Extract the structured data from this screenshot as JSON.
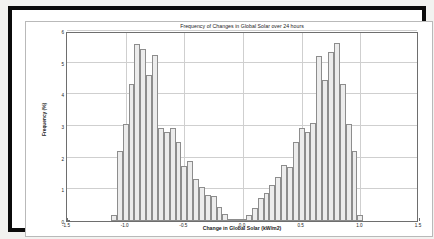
{
  "chart_data": {
    "type": "bar",
    "title": "Frequency of Changes in Global Solar over 24 hours",
    "xlabel": "Change in Global Solar (kW/m2)",
    "ylabel": "Frequency (%)",
    "xlim": [
      -1.5,
      1.5
    ],
    "ylim": [
      0,
      6
    ],
    "xticks": [
      "-1.5",
      "-1.0",
      "-0.5",
      "0.0",
      "0.5",
      "1.0",
      "1.5"
    ],
    "xtick_values": [
      -1.5,
      -1.0,
      -0.5,
      0.0,
      0.5,
      1.0,
      1.5
    ],
    "yticks": [
      "0",
      "1",
      "2",
      "3",
      "4",
      "5",
      "6"
    ],
    "ytick_values": [
      0,
      1,
      2,
      3,
      4,
      5,
      6
    ],
    "grid": true,
    "legend": null,
    "bin_width": 0.05,
    "bar_fill": "#ececec",
    "bar_edge": "#8d8d8d",
    "x": [
      -1.1,
      -1.05,
      -1.0,
      -0.95,
      -0.9,
      -0.85,
      -0.8,
      -0.75,
      -0.7,
      -0.65,
      -0.6,
      -0.55,
      -0.5,
      -0.45,
      -0.4,
      -0.35,
      -0.3,
      -0.25,
      -0.2,
      -0.15,
      -0.1,
      -0.05,
      0.0,
      0.05,
      0.1,
      0.15,
      0.2,
      0.25,
      0.3,
      0.35,
      0.4,
      0.45,
      0.5,
      0.55,
      0.6,
      0.65,
      0.7,
      0.75,
      0.8,
      0.85,
      0.9,
      0.95,
      1.0,
      1.05
    ],
    "values": [
      0.18,
      2.22,
      3.05,
      4.32,
      5.58,
      5.42,
      4.62,
      5.25,
      2.95,
      2.82,
      2.93,
      2.48,
      1.73,
      1.88,
      1.32,
      1.08,
      0.82,
      0.78,
      0.44,
      0.22,
      0.06,
      0.03,
      0.04,
      0.2,
      0.42,
      0.72,
      0.88,
      1.14,
      1.4,
      1.78,
      1.72,
      2.48,
      2.93,
      2.8,
      3.08,
      5.22,
      4.46,
      5.35,
      5.62,
      4.32,
      3.05,
      2.22,
      0.2,
      0.0
    ],
    "peaks": [
      {
        "side": "left",
        "x": -0.9,
        "value": 5.58
      },
      {
        "side": "right",
        "x": 0.8,
        "value": 5.62
      }
    ]
  }
}
